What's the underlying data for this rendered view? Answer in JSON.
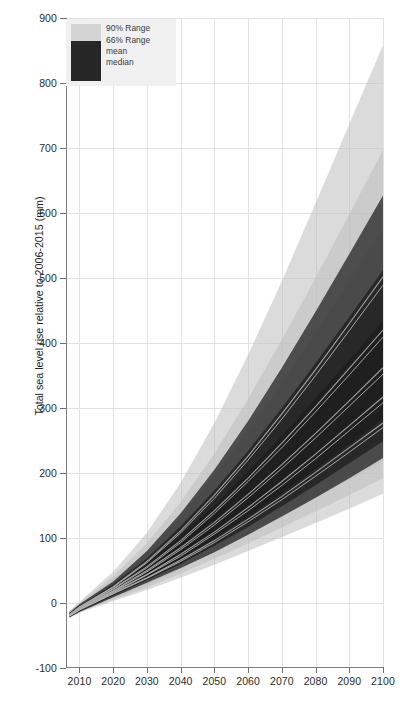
{
  "chart_data": {
    "type": "area",
    "title": "",
    "subtitle": "",
    "xlabel": "",
    "ylabel": "Total sea level rise relative to 2006-2015 (mm)",
    "xlim": [
      2006,
      2100
    ],
    "ylim": [
      -100,
      900
    ],
    "xticks": [
      2010,
      2020,
      2030,
      2040,
      2050,
      2060,
      2070,
      2080,
      2090,
      2100
    ],
    "yticks": [
      -100,
      0,
      100,
      200,
      300,
      400,
      500,
      600,
      700,
      800,
      900
    ],
    "grid": true,
    "legend_position": "top-left",
    "legend": [
      {
        "label": "90% Range",
        "color": "#d4d4d4"
      },
      {
        "label": "66% Range",
        "color": "#262626"
      },
      {
        "label": "mean",
        "color": "#9a9a9a"
      },
      {
        "label": "median",
        "color": "#b5b5b5"
      }
    ],
    "x": [
      2007,
      2010,
      2020,
      2030,
      2040,
      2050,
      2060,
      2070,
      2080,
      2090,
      2100
    ],
    "series": [
      {
        "name": "scenario-high",
        "range90_upper": [
          -12,
          2,
          48,
          108,
          185,
          277,
          382,
          495,
          615,
          737,
          858
        ],
        "range90_lower": [
          -22,
          -12,
          12,
          38,
          70,
          104,
          140,
          176,
          214,
          252,
          290
        ],
        "range66_upper": [
          -15,
          -2,
          33,
          80,
          138,
          205,
          280,
          362,
          448,
          537,
          627
        ],
        "range66_lower": [
          -21,
          -10,
          18,
          50,
          88,
          130,
          176,
          224,
          274,
          325,
          377
        ],
        "mean": [
          -18,
          -6,
          25,
          64,
          111,
          166,
          226,
          291,
          359,
          430,
          502
        ],
        "median": [
          -18,
          -6,
          24,
          62,
          108,
          161,
          220,
          283,
          350,
          419,
          489
        ]
      },
      {
        "name": "scenario-mid-high",
        "range90_upper": [
          -13,
          0,
          41,
          92,
          155,
          230,
          314,
          405,
          500,
          598,
          697
        ],
        "range90_lower": [
          -22,
          -13,
          9,
          32,
          60,
          90,
          121,
          153,
          186,
          219,
          252
        ],
        "range66_upper": [
          -16,
          -4,
          29,
          69,
          118,
          173,
          234,
          300,
          369,
          440,
          512
        ],
        "range66_lower": [
          -21,
          -11,
          15,
          44,
          77,
          113,
          152,
          193,
          236,
          280,
          324
        ],
        "mean": [
          -18,
          -7,
          22,
          56,
          96,
          142,
          192,
          246,
          302,
          361,
          420
        ],
        "median": [
          -19,
          -8,
          21,
          54,
          93,
          138,
          187,
          239,
          294,
          351,
          409
        ]
      },
      {
        "name": "scenario-mid",
        "range90_upper": [
          -14,
          -1,
          36,
          80,
          134,
          196,
          265,
          339,
          416,
          496,
          576
        ],
        "range90_lower": [
          -22,
          -13,
          7,
          28,
          52,
          78,
          105,
          133,
          161,
          190,
          219
        ],
        "range66_upper": [
          -17,
          -5,
          26,
          61,
          103,
          150,
          202,
          257,
          315,
          374,
          434
        ],
        "range66_lower": [
          -21,
          -12,
          13,
          39,
          68,
          99,
          133,
          169,
          206,
          244,
          283
        ],
        "mean": [
          -19,
          -8,
          19,
          50,
          85,
          124,
          167,
          213,
          261,
          311,
          362
        ],
        "median": [
          -19,
          -9,
          18,
          48,
          82,
          120,
          162,
          207,
          254,
          303,
          352
        ]
      },
      {
        "name": "scenario-mid-low",
        "range90_upper": [
          -15,
          -3,
          31,
          70,
          116,
          169,
          227,
          289,
          354,
          420,
          488
        ],
        "range90_lower": [
          -23,
          -14,
          5,
          24,
          45,
          68,
          92,
          116,
          141,
          166,
          192
        ],
        "range66_upper": [
          -18,
          -7,
          23,
          54,
          90,
          131,
          176,
          223,
          273,
          324,
          376
        ],
        "range66_lower": [
          -22,
          -13,
          11,
          35,
          60,
          88,
          117,
          149,
          181,
          215,
          249
        ],
        "mean": [
          -19,
          -9,
          17,
          44,
          75,
          109,
          147,
          187,
          229,
          273,
          317
        ],
        "median": [
          -20,
          -10,
          16,
          43,
          72,
          106,
          142,
          181,
          222,
          265,
          308
        ]
      },
      {
        "name": "scenario-low",
        "range90_upper": [
          -16,
          -4,
          27,
          61,
          101,
          146,
          195,
          248,
          303,
          359,
          417
        ],
        "range90_lower": [
          -23,
          -15,
          3,
          20,
          39,
          59,
          80,
          101,
          123,
          145,
          168
        ],
        "range66_upper": [
          -18,
          -8,
          20,
          48,
          79,
          114,
          153,
          194,
          237,
          281,
          326
        ],
        "range66_lower": [
          -22,
          -14,
          9,
          31,
          54,
          78,
          105,
          133,
          162,
          192,
          223
        ],
        "mean": [
          -20,
          -10,
          15,
          39,
          66,
          96,
          129,
          164,
          201,
          239,
          277
        ],
        "median": [
          -20,
          -11,
          14,
          38,
          64,
          93,
          125,
          159,
          195,
          232,
          270
        ]
      }
    ]
  },
  "caption": {
    "text": ""
  }
}
